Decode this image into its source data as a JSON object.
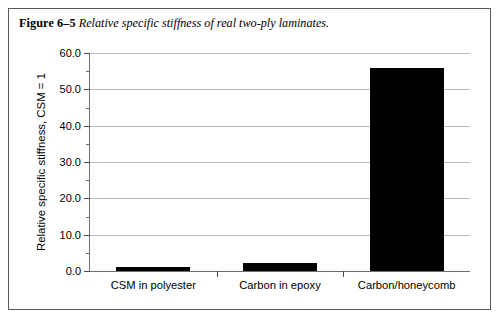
{
  "figure": {
    "label": "Figure 6–5",
    "caption": "Relative specific stiffness of real two-ply laminates."
  },
  "chart_data": {
    "type": "bar",
    "title": "",
    "xlabel": "",
    "ylabel": "Relative specific stiffness, CSM = 1",
    "categories": [
      "CSM in polyester",
      "Carbon in epoxy",
      "Carbon/honeycomb"
    ],
    "values": [
      1.0,
      2.3,
      56.0
    ],
    "ylim": [
      0.0,
      60.0
    ],
    "ytick_values": [
      0.0,
      10.0,
      20.0,
      30.0,
      40.0,
      50.0,
      60.0
    ],
    "ytick_labels": [
      "0.0",
      "10.0",
      "20.0",
      "30.0",
      "40.0",
      "50.0",
      "60.0"
    ],
    "yminor_values": [
      5.0,
      15.0,
      25.0,
      35.0,
      45.0,
      55.0
    ],
    "grid": true,
    "legend": false,
    "bar_color": "#000000",
    "grid_color": "#b9b9b9",
    "axis_color": "#6f6f6f"
  }
}
